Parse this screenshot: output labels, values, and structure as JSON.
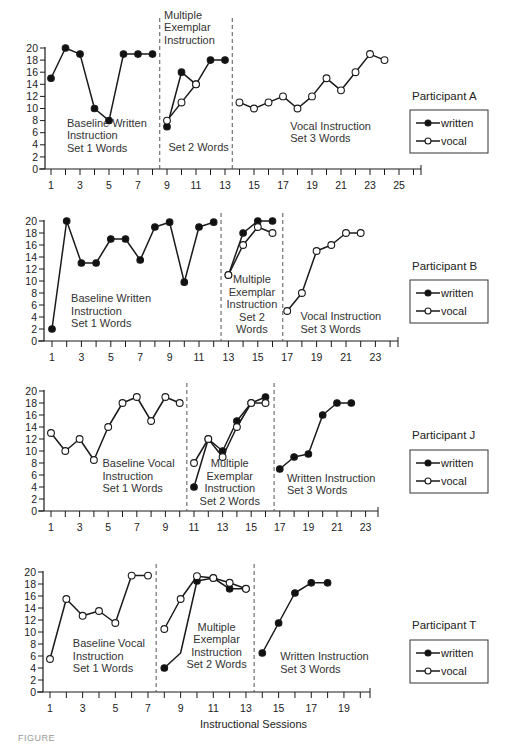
{
  "figure": {
    "xlabel": "Instructional Sessions",
    "caption": "FIGURE",
    "colors": {
      "line": "#1a1a1a",
      "written_fill": "#111111",
      "vocal_fill": "#ffffff",
      "dash": "#555555"
    }
  },
  "chart_data": [
    {
      "type": "line",
      "participant": "Participant A",
      "legend": [
        "written",
        "vocal"
      ],
      "ylim": [
        0,
        20
      ],
      "yticks": [
        0,
        2,
        4,
        6,
        8,
        10,
        12,
        14,
        16,
        18,
        20
      ],
      "xticks_labeled": [
        1,
        3,
        5,
        7,
        9,
        11,
        13,
        15,
        17,
        19,
        21,
        23,
        25
      ],
      "xlim": [
        0.5,
        26
      ],
      "phase_lines": [
        8.5,
        13.5
      ],
      "phase_labels": [
        {
          "lines": [
            "Baseline Written",
            "Instruction",
            "Set 1 Words"
          ],
          "x": 2.1,
          "y": 7
        },
        {
          "lines": [
            "Multiple",
            "Exemplar",
            "Instruction"
          ],
          "x": 8.8,
          "y": 24.8
        },
        {
          "lines": [
            "Set 2 Words"
          ],
          "x": 9.1,
          "y": 3
        },
        {
          "lines": [
            "Vocal Instruction",
            "Set 3 Words"
          ],
          "x": 17.5,
          "y": 6.5
        }
      ],
      "series": [
        {
          "name": "written",
          "segments": [
            {
              "x": [
                1,
                2,
                3,
                4,
                5,
                6,
                7,
                8
              ],
              "y": [
                15,
                20,
                19,
                10,
                8,
                19,
                19,
                19
              ]
            },
            {
              "x": [
                9,
                10,
                11,
                12,
                13
              ],
              "y": [
                7,
                16,
                14,
                18,
                18
              ]
            }
          ]
        },
        {
          "name": "vocal",
          "segments": [
            {
              "x": [
                9,
                10,
                11
              ],
              "y": [
                8,
                11,
                14
              ]
            },
            {
              "x": [
                14,
                15,
                16,
                17,
                18,
                19,
                20,
                21,
                22,
                23,
                24
              ],
              "y": [
                11,
                10,
                11,
                12,
                10,
                12,
                15,
                13,
                16,
                19,
                18
              ]
            }
          ]
        }
      ],
      "layout": {
        "x0": 51,
        "dx": 14.5,
        "y0": 169,
        "y20": 48,
        "axis_left": 45,
        "axis_right": 421,
        "legend_title_y": 100,
        "legend_box": [
          410,
          110,
          78,
          43
        ]
      }
    },
    {
      "type": "line",
      "participant": "Participant B",
      "legend": [
        "written",
        "vocal"
      ],
      "ylim": [
        0,
        20
      ],
      "yticks": [
        0,
        2,
        4,
        6,
        8,
        10,
        12,
        14,
        16,
        18,
        20
      ],
      "xticks_labeled": [
        1,
        3,
        5,
        7,
        9,
        11,
        13,
        15,
        17,
        19,
        21,
        23
      ],
      "xlim": [
        0.5,
        24.5
      ],
      "phase_lines": [
        12.5,
        16.7
      ],
      "phase_labels": [
        {
          "lines": [
            "Baseline Written",
            "Instruction",
            "Set 1 Words"
          ],
          "x": 2.3,
          "y": 6.5
        },
        {
          "lines": [
            "Multiple",
            "Exemplar",
            "Instruction",
            "Set 2",
            "Words"
          ],
          "x": 14.6,
          "y": 9.6,
          "anchor": "middle"
        },
        {
          "lines": [
            "Vocal Instruction",
            "Set 3 Words"
          ],
          "x": 17.9,
          "y": 3.5
        }
      ],
      "series": [
        {
          "name": "written",
          "segments": [
            {
              "x": [
                1,
                2,
                3,
                4,
                5,
                6,
                7,
                8,
                9,
                10,
                11,
                12
              ],
              "y": [
                2,
                20,
                13,
                13,
                17,
                17,
                13.5,
                19,
                19.8,
                9.8,
                19,
                19.8
              ]
            },
            {
              "x": [
                13,
                14,
                15,
                16
              ],
              "y": [
                11,
                18,
                20,
                20
              ]
            }
          ]
        },
        {
          "name": "vocal",
          "segments": [
            {
              "x": [
                13,
                14,
                15,
                16
              ],
              "y": [
                11,
                16,
                19,
                18
              ]
            },
            {
              "x": [
                17,
                18,
                19,
                20,
                21,
                22
              ],
              "y": [
                5,
                8,
                15,
                16,
                18,
                18
              ]
            }
          ]
        }
      ],
      "layout": {
        "x0": 52,
        "dx": 14.7,
        "y0": 341,
        "y20": 221,
        "axis_left": 44,
        "axis_right": 398,
        "legend_title_y": 270,
        "legend_box": [
          410,
          280,
          78,
          43
        ]
      }
    },
    {
      "type": "line",
      "participant": "Participant J",
      "legend": [
        "written",
        "vocal"
      ],
      "ylim": [
        0,
        20
      ],
      "yticks": [
        0,
        2,
        4,
        6,
        8,
        10,
        12,
        14,
        16,
        18,
        20
      ],
      "xticks_labeled": [
        1,
        3,
        5,
        7,
        9,
        11,
        13,
        15,
        17,
        19,
        21,
        23
      ],
      "xlim": [
        0.5,
        24
      ],
      "phase_lines": [
        10.5,
        16.6
      ],
      "phase_labels": [
        {
          "lines": [
            "Baseline Vocal",
            "Instruction",
            "Set 1 Words"
          ],
          "x": 4.6,
          "y": 7.3
        },
        {
          "lines": [
            "Multiple",
            "Exemplar",
            "Instruction",
            "Set 2 Words"
          ],
          "x": 13.5,
          "y": 7.3,
          "anchor": "middle"
        },
        {
          "lines": [
            "Written Instruction",
            "Set 3 Words"
          ],
          "x": 17.5,
          "y": 4.9
        }
      ],
      "series": [
        {
          "name": "written",
          "segments": [
            {
              "x": [
                11,
                12,
                13,
                14,
                15,
                16
              ],
              "y": [
                4,
                12,
                10,
                15,
                18,
                19
              ]
            },
            {
              "x": [
                17,
                18,
                19,
                20,
                21,
                22
              ],
              "y": [
                7,
                9,
                9.5,
                16,
                18,
                18
              ]
            }
          ]
        },
        {
          "name": "vocal",
          "segments": [
            {
              "x": [
                1,
                2,
                3,
                4,
                5,
                6,
                7,
                8,
                9,
                10
              ],
              "y": [
                13,
                10,
                12,
                8.5,
                14,
                18,
                19,
                15,
                19,
                18
              ]
            },
            {
              "x": [
                11,
                12,
                13,
                14,
                15,
                16
              ],
              "y": [
                8,
                12,
                9,
                14,
                18,
                18
              ]
            }
          ]
        }
      ],
      "layout": {
        "x0": 51,
        "dx": 14.3,
        "y0": 511,
        "y20": 391,
        "axis_left": 44,
        "axis_right": 378,
        "legend_title_y": 439,
        "legend_box": [
          410,
          450,
          78,
          43
        ]
      }
    },
    {
      "type": "line",
      "participant": "Participant T",
      "legend": [
        "written",
        "vocal"
      ],
      "ylim": [
        0,
        20
      ],
      "yticks": [
        0,
        2,
        4,
        6,
        8,
        10,
        12,
        14,
        16,
        18,
        20
      ],
      "xticks_labeled": [
        1,
        3,
        5,
        7,
        9,
        11,
        13,
        15,
        17,
        19
      ],
      "xlim": [
        0.5,
        20.6
      ],
      "phase_lines": [
        7.5,
        13.5
      ],
      "phase_labels": [
        {
          "lines": [
            "Baseline Vocal",
            "Instruction",
            "Set 1 Words"
          ],
          "x": 2.4,
          "y": 7.5
        },
        {
          "lines": [
            "Multiple",
            "Exemplar",
            "Instruction",
            "Set 2 Words"
          ],
          "x": 11.2,
          "y": 10.2,
          "anchor": "middle"
        },
        {
          "lines": [
            "Written Instruction",
            "Set 3 Words"
          ],
          "x": 15.1,
          "y": 5.3
        }
      ],
      "series": [
        {
          "name": "written",
          "segments": [
            {
              "x": [
                8,
                9,
                10,
                11,
                12,
                13
              ],
              "y": [
                4,
                6.5,
                18.5,
                19,
                17.2,
                17.2
              ],
              "hidden_markers": [
                9
              ]
            },
            {
              "x": [
                14,
                15,
                16,
                17,
                18
              ],
              "y": [
                6.5,
                11.5,
                16.5,
                18.2,
                18.2
              ]
            }
          ]
        },
        {
          "name": "vocal",
          "segments": [
            {
              "x": [
                1,
                2,
                3,
                4,
                5,
                6,
                7
              ],
              "y": [
                5.5,
                15.5,
                12.7,
                13.5,
                11.5,
                19.4,
                19.4
              ]
            },
            {
              "x": [
                8,
                9,
                10,
                11,
                12,
                13
              ],
              "y": [
                10.5,
                15.5,
                19.3,
                19,
                18.2,
                17.2
              ]
            }
          ]
        }
      ],
      "layout": {
        "x0": 50,
        "dx": 16.33,
        "y0": 692,
        "y20": 572,
        "axis_left": 43,
        "axis_right": 370,
        "legend_title_y": 629,
        "legend_box": [
          410,
          640,
          78,
          43
        ]
      }
    }
  ]
}
